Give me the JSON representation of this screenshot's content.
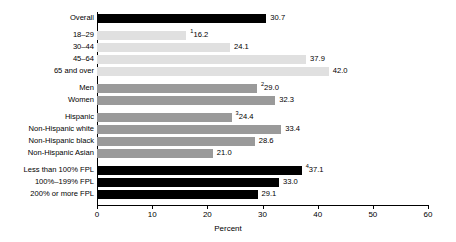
{
  "chart_data": {
    "type": "bar",
    "orientation": "horizontal",
    "title": "",
    "xlabel": "Percent",
    "ylabel": "",
    "xlim": [
      0,
      60
    ],
    "xticks": [
      0,
      10,
      20,
      30,
      40,
      50,
      60
    ],
    "grid": false,
    "legend": null,
    "categories": [
      "Overall",
      "18–29",
      "30–44",
      "45–64",
      "65 and over",
      "Men",
      "Women",
      "Hispanic",
      "Non-Hispanic white",
      "Non-Hispanic black",
      "Non-Hispanic Asian",
      "Less than 100% FPL",
      "100%–199% FPL",
      "200% or more FPL"
    ],
    "values": [
      30.7,
      16.2,
      24.1,
      37.9,
      42.0,
      29.0,
      32.3,
      24.4,
      33.4,
      28.6,
      21.0,
      37.1,
      33.0,
      29.1
    ],
    "data_labels": [
      "30.7",
      "16.2",
      "24.1",
      "37.9",
      "42.0",
      "29.0",
      "32.3",
      "24.4",
      "33.4",
      "28.6",
      "21.0",
      "37.1",
      "33.0",
      "29.1"
    ],
    "footnote_markers": [
      "",
      "1",
      "",
      "",
      "",
      "2",
      "",
      "3",
      "",
      "",
      "",
      "4",
      "",
      ""
    ],
    "colors": {
      "overall": "#000000",
      "age": "#e0e0e0",
      "sex": "#9a9a9a",
      "race": "#9a9a9a",
      "income": "#000000",
      "axis": "#000000"
    },
    "groups": [
      {
        "name": "overall",
        "color_key": "overall",
        "indices": [
          0
        ]
      },
      {
        "name": "age",
        "color_key": "age",
        "indices": [
          1,
          2,
          3,
          4
        ]
      },
      {
        "name": "sex",
        "color_key": "sex",
        "indices": [
          5,
          6
        ]
      },
      {
        "name": "race",
        "color_key": "race",
        "indices": [
          7,
          8,
          9,
          10
        ]
      },
      {
        "name": "income",
        "color_key": "income",
        "indices": [
          11,
          12,
          13
        ]
      }
    ]
  }
}
